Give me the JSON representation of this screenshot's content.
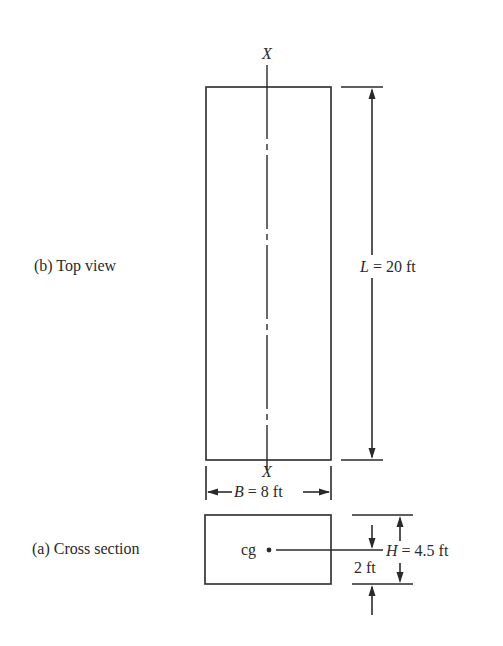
{
  "figure": {
    "top_view": {
      "caption": "(b)  Top view",
      "axis_label_top": "X",
      "axis_label_bottom": "X",
      "length": {
        "symbol": "L",
        "value_text": "= 20 ft"
      },
      "breadth": {
        "symbol": "B",
        "value_text": "= 8 ft"
      }
    },
    "cross_section": {
      "caption": "(a)  Cross section",
      "cg_label": "cg",
      "height": {
        "symbol": "H",
        "value_text": "= 4.5 ft"
      },
      "cg_offset_text": "2 ft"
    }
  },
  "colors": {
    "line": "#2a2a2a",
    "background": "#ffffff"
  }
}
